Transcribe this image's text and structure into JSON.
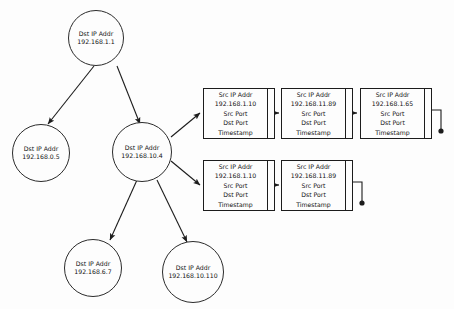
{
  "diagram": {
    "stroke_color": "#1c1c1c",
    "background_color": "#fdfdfd",
    "nodes": [
      {
        "id": "root",
        "label": "Dst IP Addr",
        "value": "192.168.1.1"
      },
      {
        "id": "left",
        "label": "Dst IP Addr",
        "value": "192.168.0.5"
      },
      {
        "id": "center",
        "label": "Dst IP Addr",
        "value": "192.168.10.4"
      },
      {
        "id": "lower1",
        "label": "Dst IP Addr",
        "value": "192.168.6.7"
      },
      {
        "id": "lower2",
        "label": "Dst IP Addr",
        "value": "192.168.10.110"
      }
    ],
    "chains": [
      {
        "id": "chain-top",
        "records": [
          {
            "label": "Src IP Addr",
            "value": "192.168.1.10",
            "fields": [
              "Src Port",
              "Dst Port",
              "Timestamp"
            ]
          },
          {
            "label": "Src IP Addr",
            "value": "192.168.11.89",
            "fields": [
              "Src Port",
              "Dst Port",
              "Timestamp"
            ]
          },
          {
            "label": "Src IP Addr",
            "value": "192.168.1.65",
            "fields": [
              "Src Port",
              "Dst Port",
              "Timestamp"
            ]
          }
        ]
      },
      {
        "id": "chain-bottom",
        "records": [
          {
            "label": "Src IP Addr",
            "value": "192.168.1.10",
            "fields": [
              "Src Port",
              "Dst Port",
              "Timestamp"
            ]
          },
          {
            "label": "Src IP Addr",
            "value": "192.168.11.89",
            "fields": [
              "Src Port",
              "Dst Port",
              "Timestamp"
            ]
          }
        ]
      }
    ]
  }
}
